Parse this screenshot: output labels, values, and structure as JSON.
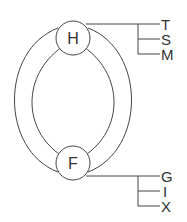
{
  "nodes": {
    "top": {
      "label": "H"
    },
    "bottom": {
      "label": "F"
    }
  },
  "top_branches": [
    "T",
    "S",
    "M"
  ],
  "bottom_branches": [
    "G",
    "I",
    "X"
  ],
  "colors": {
    "stroke": "#444444",
    "text": "#333333",
    "background": "#ffffff"
  }
}
